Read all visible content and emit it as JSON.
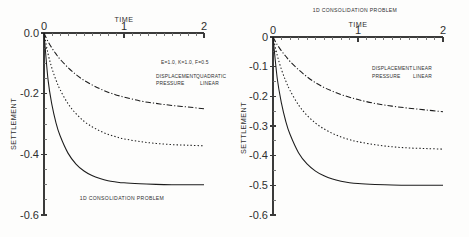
{
  "figure": {
    "panels": [
      {
        "id": "left",
        "caption": "1D CONSOLIDATION PROBLEM",
        "caption_position": "bottom",
        "parameters": "E=1.0, K=1.0, F=0.5",
        "legend": [
          {
            "field": "DISPLACEMENT",
            "separator": ":",
            "order": "QUADRATIC"
          },
          {
            "field": "PRESSURE",
            "separator": ":",
            "order": "LINEAR"
          }
        ],
        "chart_data": {
          "type": "line",
          "title": "1D CONSOLIDATION PROBLEM",
          "xlabel": "TIME",
          "ylabel": "SETTLEMENT",
          "xlim": [
            0,
            2
          ],
          "ylim": [
            -0.6,
            0.0
          ],
          "xticks": [
            0,
            1,
            2
          ],
          "xtick_labels": [
            "0",
            "1",
            "2"
          ],
          "xtick_minor_step": 0.1,
          "yticks": [
            0.0,
            -0.2,
            -0.4,
            -0.6
          ],
          "ytick_labels": [
            "0.0",
            "-0.2",
            "-0.4",
            "-0.6"
          ],
          "ytick_minor_step": 0.05,
          "x_axis_position": "top",
          "grid": false,
          "legend_position": "none",
          "x": [
            0,
            0.05,
            0.1,
            0.15,
            0.2,
            0.3,
            0.4,
            0.5,
            0.6,
            0.7,
            0.8,
            0.9,
            1.0,
            1.2,
            1.4,
            1.6,
            1.8,
            2.0
          ],
          "series": [
            {
              "name": "curve-1",
              "style": "solid",
              "asymptote": -0.5,
              "values": [
                0.0,
                -0.153,
                -0.238,
                -0.296,
                -0.338,
                -0.396,
                -0.432,
                -0.455,
                -0.47,
                -0.48,
                -0.487,
                -0.491,
                -0.494,
                -0.497,
                -0.499,
                -0.5,
                -0.5,
                -0.5
              ]
            },
            {
              "name": "curve-2",
              "style": "dotted",
              "asymptote": -0.372,
              "values": [
                0.0,
                -0.068,
                -0.117,
                -0.155,
                -0.186,
                -0.233,
                -0.266,
                -0.291,
                -0.309,
                -0.323,
                -0.334,
                -0.342,
                -0.349,
                -0.358,
                -0.364,
                -0.368,
                -0.37,
                -0.372
              ]
            },
            {
              "name": "curve-3",
              "style": "dashdot",
              "asymptote": -0.25,
              "values": [
                0.0,
                -0.028,
                -0.05,
                -0.069,
                -0.086,
                -0.114,
                -0.137,
                -0.156,
                -0.171,
                -0.184,
                -0.195,
                -0.204,
                -0.211,
                -0.224,
                -0.232,
                -0.239,
                -0.244,
                -0.25
              ]
            }
          ]
        }
      },
      {
        "id": "right",
        "caption": "1D CONSOLIDATION PROBLEM",
        "caption_position": "top",
        "parameters": "",
        "legend": [
          {
            "field": "DISPLACEMENT",
            "separator": ":",
            "order": "LINEAR"
          },
          {
            "field": "PRESSURE",
            "separator": ":",
            "order": "LINEAR"
          }
        ],
        "chart_data": {
          "type": "line",
          "title": "1D CONSOLIDATION PROBLEM",
          "xlabel": "TIME",
          "ylabel": "SETTLEMENT",
          "xlim": [
            0,
            2
          ],
          "ylim": [
            -0.6,
            0.0
          ],
          "xticks": [
            0,
            1,
            2
          ],
          "xtick_labels": [
            "0",
            "1",
            "2"
          ],
          "xtick_minor_step": 0.1,
          "yticks": [
            0.0,
            -0.1,
            -0.2,
            -0.3,
            -0.4,
            -0.5,
            -0.6
          ],
          "ytick_labels": [
            "0",
            "-0.1",
            "-0.2",
            "-0.3",
            "-0.4",
            "-0.5",
            "-0.6"
          ],
          "ytick_minor_step": 0.05,
          "x_axis_position": "top",
          "grid": false,
          "legend_position": "none",
          "x": [
            0,
            0.05,
            0.1,
            0.15,
            0.2,
            0.3,
            0.4,
            0.5,
            0.6,
            0.7,
            0.8,
            0.9,
            1.0,
            1.2,
            1.4,
            1.6,
            1.8,
            2.0
          ],
          "series": [
            {
              "name": "curve-1",
              "style": "solid",
              "asymptote": -0.5,
              "values": [
                0.0,
                -0.14,
                -0.224,
                -0.284,
                -0.328,
                -0.39,
                -0.428,
                -0.452,
                -0.468,
                -0.479,
                -0.486,
                -0.491,
                -0.494,
                -0.497,
                -0.499,
                -0.5,
                -0.5,
                -0.5
              ]
            },
            {
              "name": "curve-2",
              "style": "dotted",
              "asymptote": -0.378,
              "values": [
                0.0,
                -0.062,
                -0.11,
                -0.148,
                -0.18,
                -0.229,
                -0.264,
                -0.29,
                -0.31,
                -0.325,
                -0.337,
                -0.346,
                -0.353,
                -0.363,
                -0.37,
                -0.374,
                -0.376,
                -0.378
              ]
            },
            {
              "name": "curve-3",
              "style": "dashdot",
              "asymptote": -0.252,
              "values": [
                0.0,
                -0.026,
                -0.047,
                -0.065,
                -0.082,
                -0.11,
                -0.134,
                -0.154,
                -0.17,
                -0.183,
                -0.194,
                -0.203,
                -0.211,
                -0.224,
                -0.233,
                -0.24,
                -0.246,
                -0.252
              ]
            }
          ]
        }
      }
    ]
  }
}
